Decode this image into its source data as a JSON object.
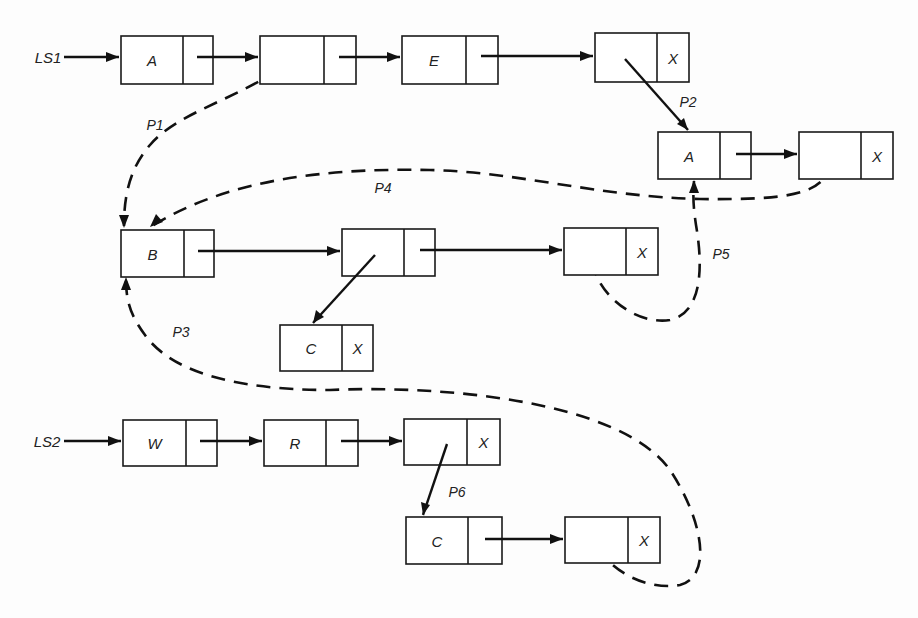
{
  "diagram": {
    "type": "linked-list-structure",
    "colors": {
      "ink": "#111111",
      "background": "#fdfdfd"
    },
    "heads": [
      {
        "id": "LS1",
        "label": "LS1",
        "x": 48,
        "y": 57
      },
      {
        "id": "LS2",
        "label": "LS2",
        "x": 47,
        "y": 441
      }
    ],
    "nodes": [
      {
        "id": "n1",
        "label": "A",
        "next": "",
        "x": 121,
        "y": 36,
        "w": 92,
        "h": 48,
        "split": 62
      },
      {
        "id": "n2",
        "label": "",
        "next": "",
        "x": 260,
        "y": 36,
        "w": 96,
        "h": 48,
        "split": 64
      },
      {
        "id": "n3",
        "label": "E",
        "next": "",
        "x": 402,
        "y": 36,
        "w": 96,
        "h": 48,
        "split": 64
      },
      {
        "id": "n4",
        "label": "",
        "next": "X",
        "x": 595,
        "y": 33,
        "w": 94,
        "h": 49,
        "split": 62
      },
      {
        "id": "n5",
        "label": "A",
        "next": "",
        "x": 658,
        "y": 132,
        "w": 93,
        "h": 47,
        "split": 62
      },
      {
        "id": "n6",
        "label": "",
        "next": "X",
        "x": 799,
        "y": 132,
        "w": 94,
        "h": 47,
        "split": 62
      },
      {
        "id": "n7",
        "label": "B",
        "next": "",
        "x": 121,
        "y": 230,
        "w": 93,
        "h": 47,
        "split": 63
      },
      {
        "id": "n8",
        "label": "",
        "next": "",
        "x": 342,
        "y": 229,
        "w": 93,
        "h": 47,
        "split": 62
      },
      {
        "id": "n9",
        "label": "",
        "next": "X",
        "x": 564,
        "y": 228,
        "w": 94,
        "h": 47,
        "split": 62
      },
      {
        "id": "n10",
        "label": "C",
        "next": "X",
        "x": 280,
        "y": 325,
        "w": 93,
        "h": 46,
        "split": 62
      },
      {
        "id": "n11",
        "label": "W",
        "next": "",
        "x": 123,
        "y": 420,
        "w": 94,
        "h": 46,
        "split": 63
      },
      {
        "id": "n12",
        "label": "R",
        "next": "",
        "x": 264,
        "y": 420,
        "w": 94,
        "h": 46,
        "split": 62
      },
      {
        "id": "n13",
        "label": "",
        "next": "X",
        "x": 404,
        "y": 419,
        "w": 96,
        "h": 46,
        "split": 63
      },
      {
        "id": "n14",
        "label": "C",
        "next": "",
        "x": 406,
        "y": 517,
        "w": 96,
        "h": 47,
        "split": 62
      },
      {
        "id": "n15",
        "label": "",
        "next": "X",
        "x": 565,
        "y": 517,
        "w": 95,
        "h": 46,
        "split": 63
      }
    ],
    "pointer_labels": [
      {
        "id": "P1",
        "label": "P1",
        "x": 155,
        "y": 125
      },
      {
        "id": "P2",
        "label": "P2",
        "x": 688,
        "y": 102
      },
      {
        "id": "P3",
        "label": "P3",
        "x": 181,
        "y": 332
      },
      {
        "id": "P4",
        "label": "P4",
        "x": 383,
        "y": 188
      },
      {
        "id": "P5",
        "label": "P5",
        "x": 721,
        "y": 254
      },
      {
        "id": "P6",
        "label": "P6",
        "x": 457,
        "y": 492
      }
    ],
    "solid_edges": [
      {
        "from": "LS1",
        "to": "n1",
        "d": "M64,57 L119,57"
      },
      {
        "from": "n1",
        "to": "n2",
        "d": "M197,57 L258,57"
      },
      {
        "from": "n2",
        "to": "n3",
        "d": "M339,57 L400,57"
      },
      {
        "from": "n3",
        "to": "n4",
        "d": "M481,56 L593,56"
      },
      {
        "from": "n4",
        "to": "n5",
        "d": "M625,59 L688,130"
      },
      {
        "from": "n5",
        "to": "n6",
        "d": "M736,154 L797,154"
      },
      {
        "from": "n7",
        "to": "n8",
        "d": "M198,251 L340,251"
      },
      {
        "from": "n8",
        "to": "n9",
        "d": "M420,250 L562,250"
      },
      {
        "from": "n8",
        "to": "n10",
        "d": "M375,255 L313,323"
      },
      {
        "from": "LS2",
        "to": "n11",
        "d": "M64,441 L121,441"
      },
      {
        "from": "n11",
        "to": "n12",
        "d": "M200,441 L262,441"
      },
      {
        "from": "n12",
        "to": "n13",
        "d": "M341,441 L402,441"
      },
      {
        "from": "n13",
        "to": "n14",
        "d": "M447,444 L423,515"
      },
      {
        "from": "n14",
        "to": "n15",
        "d": "M485,539 L563,539"
      }
    ],
    "dashed_edges": [
      {
        "id": "P1",
        "from": "n2",
        "to": "n7",
        "d": "M297,57 C 240,100 180,110 150,145 C 128,170 124,200 124,226"
      },
      {
        "id": "P4",
        "from": "n6",
        "to": "n7",
        "d": "M831,162 C 825,195 790,200 700,199 C 600,197 520,172 430,170 C 330,168 230,178 152,226"
      },
      {
        "id": "P5",
        "from": "n9",
        "to": "n5",
        "d": "M592,262 C 600,300 640,325 670,320 C 705,312 702,260 696,225 C 693,205 693,195 694,181"
      },
      {
        "id": "P3",
        "from": "n15",
        "to": "n7",
        "d": "M598,548 C 615,575 650,590 680,585 C 715,575 700,515 670,470 C 620,400 440,385 330,390 C 230,390 170,370 145,335 C 130,315 126,300 126,279"
      }
    ],
    "arrowheads": [
      {
        "points": "119,57 106,52 106,62"
      },
      {
        "points": "258,57 245,52 245,62"
      },
      {
        "points": "400,57 387,52 387,62"
      },
      {
        "points": "593,56 580,51 580,61"
      },
      {
        "points": "688,130 677,124 684,118"
      },
      {
        "points": "797,154 784,149 784,159"
      },
      {
        "points": "340,251 327,246 327,256"
      },
      {
        "points": "562,250 549,245 549,255"
      },
      {
        "points": "313,323 316,310 324,317"
      },
      {
        "points": "121,441 108,436 108,446"
      },
      {
        "points": "262,441 249,436 249,446"
      },
      {
        "points": "402,441 389,436 389,446"
      },
      {
        "points": "423,515 421,502 430,505"
      },
      {
        "points": "563,539 550,534 550,544"
      },
      {
        "points": "124,228 119,215 129,215"
      },
      {
        "points": "150,227 156,214 163,222"
      },
      {
        "points": "694,180 689,193 699,193"
      },
      {
        "points": "126,277 121,290 131,290"
      }
    ]
  }
}
